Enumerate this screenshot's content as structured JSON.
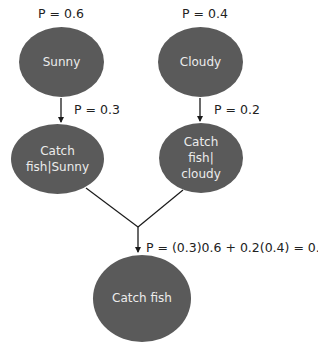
{
  "colors": {
    "node_fill": "#5a5a5a",
    "node_text": "#ececec",
    "edge": "#1a1a1a",
    "label_text": "#222222",
    "background": "#ffffff"
  },
  "nodes": {
    "sunny": {
      "label": "Sunny",
      "prior": "P = 0.6"
    },
    "cloudy": {
      "label": "Cloudy",
      "prior": "P = 0.4"
    },
    "catch_given_sunny": {
      "label": "Catch\nfish|Sunny",
      "edge_prob": "P = 0.3"
    },
    "catch_given_cloudy": {
      "label": "Catch\nfish|\ncloudy",
      "edge_prob": "P = 0.2"
    },
    "catch_fish": {
      "label": "Catch fish",
      "total_prob": "P = (0.3)0.6 + 0.2(0.4) = 0.26"
    }
  },
  "edges": [
    {
      "from": "sunny",
      "to": "catch_given_sunny",
      "label": "P = 0.3"
    },
    {
      "from": "cloudy",
      "to": "catch_given_cloudy",
      "label": "P = 0.2"
    },
    {
      "from": "catch_given_sunny",
      "to": "catch_fish",
      "label": ""
    },
    {
      "from": "catch_given_cloudy",
      "to": "catch_fish",
      "label": "P = (0.3)0.6 + 0.2(0.4) = 0.26"
    }
  ]
}
